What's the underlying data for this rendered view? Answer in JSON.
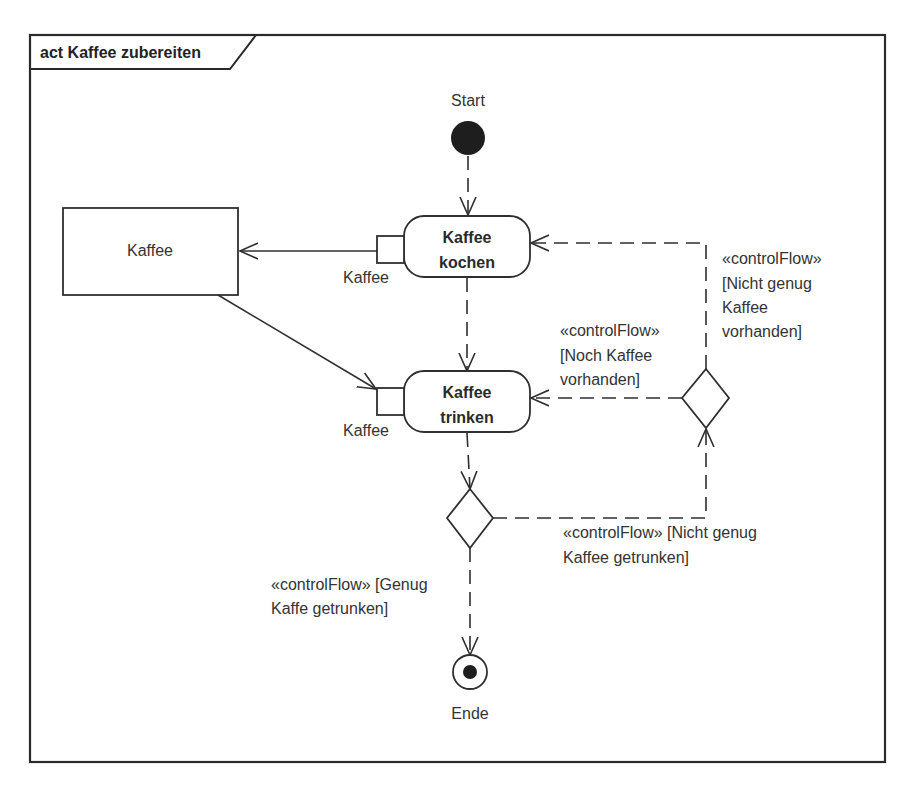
{
  "diagram": {
    "frame_title": "act Kaffee zubereiten",
    "start": {
      "label": "Start"
    },
    "end": {
      "label": "Ende"
    },
    "object_node": {
      "label": "Kaffee"
    },
    "actions": [
      {
        "line1": "Kaffee",
        "line2": "kochen",
        "pin_label": "Kaffee"
      },
      {
        "line1": "Kaffee",
        "line2": "trinken",
        "pin_label": "Kaffee"
      }
    ],
    "guards": {
      "nicht_genug_vorhanden": [
        "«controlFlow»",
        "[Nicht genug",
        "Kaffee",
        "vorhanden]"
      ],
      "noch_vorhanden": [
        "«controlFlow»",
        "[Noch Kaffee",
        "vorhanden]"
      ],
      "nicht_genug_getrunken": [
        "«controlFlow» [Nicht genug",
        "Kaffee getrunken]"
      ],
      "genug_getrunken": [
        "«controlFlow» [Genug",
        "Kaffe getrunken]"
      ]
    },
    "colors": {
      "line": "#2f2f2f",
      "text": "#333333",
      "background": "#ffffff"
    }
  }
}
